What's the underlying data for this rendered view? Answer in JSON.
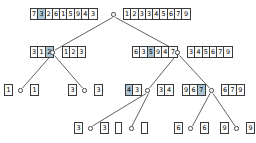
{
  "figure": {
    "type": "merge-sort-recursion-tree",
    "colors": {
      "highlight": "#aac4d4",
      "cell_bg": "#fbfbfb",
      "border": "#3a3a3a",
      "background": "#ffffff"
    }
  },
  "nodes": [
    {
      "id": "root",
      "level": 0,
      "node_x": 113.5,
      "node_y": 14.5,
      "input": {
        "x": 30,
        "y": 8,
        "values": [
          "7",
          "3",
          "2",
          "6",
          "1",
          "5",
          "9",
          "4",
          "3"
        ],
        "highlight": [
          1
        ]
      },
      "output": {
        "x": 123,
        "y": 8,
        "values": [
          "1",
          "2",
          "3",
          "3",
          "4",
          "5",
          "6",
          "7",
          "9"
        ],
        "highlight": []
      }
    },
    {
      "id": "l1-left",
      "level": 1,
      "node_x": 52.5,
      "node_y": 52.5,
      "input": {
        "x": 30,
        "y": 46,
        "values": [
          "3",
          "1",
          "2"
        ],
        "highlight": [
          2
        ]
      },
      "output": {
        "x": 62,
        "y": 46,
        "values": [
          "1",
          "2",
          "3"
        ],
        "highlight": []
      }
    },
    {
      "id": "l1-right",
      "level": 1,
      "node_x": 177.5,
      "node_y": 52.5,
      "input": {
        "x": 132,
        "y": 46,
        "values": [
          "6",
          "3",
          "5",
          "9",
          "4",
          "7"
        ],
        "highlight": [
          2
        ]
      },
      "output": {
        "x": 187,
        "y": 46,
        "values": [
          "3",
          "4",
          "5",
          "6",
          "7",
          "9"
        ],
        "highlight": []
      }
    },
    {
      "id": "l2-a",
      "level": 2,
      "node_x": 20.5,
      "node_y": 90.5,
      "input": {
        "x": 4,
        "y": 84,
        "values": [
          "1"
        ],
        "highlight": []
      },
      "output": {
        "x": 30,
        "y": 84,
        "values": [
          "1"
        ],
        "highlight": []
      }
    },
    {
      "id": "l2-b",
      "level": 2,
      "node_x": 84.5,
      "node_y": 90.5,
      "input": {
        "x": 68,
        "y": 84,
        "values": [
          "3"
        ],
        "highlight": []
      },
      "output": {
        "x": 94,
        "y": 84,
        "values": [
          "3"
        ],
        "highlight": []
      }
    },
    {
      "id": "l2-c",
      "level": 2,
      "node_x": 147.5,
      "node_y": 90.5,
      "input": {
        "x": 125,
        "y": 84,
        "values": [
          "4",
          "3"
        ],
        "highlight": [
          0
        ]
      },
      "output": {
        "x": 157,
        "y": 84,
        "values": [
          "3",
          "4"
        ],
        "highlight": []
      }
    },
    {
      "id": "l2-d",
      "level": 2,
      "node_x": 211.5,
      "node_y": 90.5,
      "input": {
        "x": 182,
        "y": 84,
        "values": [
          "9",
          "6",
          "7"
        ],
        "highlight": [
          2
        ]
      },
      "output": {
        "x": 221,
        "y": 84,
        "values": [
          "6",
          "7",
          "9"
        ],
        "highlight": []
      }
    },
    {
      "id": "l3-a",
      "level": 3,
      "node_x": 90.5,
      "node_y": 128.5,
      "input": {
        "x": 74,
        "y": 122,
        "values": [
          "3"
        ],
        "highlight": []
      },
      "output": {
        "x": 100,
        "y": 122,
        "values": [
          "3"
        ],
        "highlight": []
      }
    },
    {
      "id": "l3-b",
      "level": 3,
      "node_x": 131.5,
      "node_y": 128.5,
      "input": {
        "x": 115,
        "y": 122,
        "values": [],
        "highlight": []
      },
      "output": {
        "x": 141,
        "y": 122,
        "values": [],
        "highlight": []
      }
    },
    {
      "id": "l3-c",
      "level": 3,
      "node_x": 190.5,
      "node_y": 128.5,
      "input": {
        "x": 174,
        "y": 122,
        "values": [
          "6"
        ],
        "highlight": []
      },
      "output": {
        "x": 200,
        "y": 122,
        "values": [
          "6"
        ],
        "highlight": []
      }
    },
    {
      "id": "l3-d",
      "level": 3,
      "node_x": 236.5,
      "node_y": 128.5,
      "input": {
        "x": 220,
        "y": 122,
        "values": [
          "9"
        ],
        "highlight": []
      },
      "output": {
        "x": 246,
        "y": 122,
        "values": [
          "9"
        ],
        "highlight": []
      }
    }
  ],
  "edges": [
    {
      "from": "root",
      "to": "l1-left",
      "x1": 112.5,
      "y1": 17.5,
      "x2": 55,
      "y2": 50
    },
    {
      "from": "root",
      "to": "l1-right",
      "x1": 115.5,
      "y1": 17.5,
      "x2": 175.5,
      "y2": 50
    },
    {
      "from": "l1-left",
      "to": "l2-a",
      "x1": 51,
      "y1": 55.5,
      "x2": 22.5,
      "y2": 88
    },
    {
      "from": "l1-left",
      "to": "l2-b",
      "x1": 54.5,
      "y1": 55.5,
      "x2": 82.5,
      "y2": 88
    },
    {
      "from": "l1-right",
      "to": "l2-c",
      "x1": 176,
      "y1": 55.5,
      "x2": 149.5,
      "y2": 88
    },
    {
      "from": "l1-right",
      "to": "l2-d",
      "x1": 179.5,
      "y1": 55.5,
      "x2": 209.5,
      "y2": 88
    },
    {
      "from": "l2-c",
      "to": "l3-a",
      "x1": 146,
      "y1": 93.5,
      "x2": 92.5,
      "y2": 126
    },
    {
      "from": "l2-c",
      "to": "l3-b",
      "x1": 148.5,
      "y1": 93.5,
      "x2": 132,
      "y2": 126
    },
    {
      "from": "l2-d",
      "to": "l3-c",
      "x1": 210,
      "y1": 93.5,
      "x2": 192.5,
      "y2": 126
    },
    {
      "from": "l2-d",
      "to": "l3-d",
      "x1": 213,
      "y1": 93.5,
      "x2": 235,
      "y2": 126
    }
  ]
}
